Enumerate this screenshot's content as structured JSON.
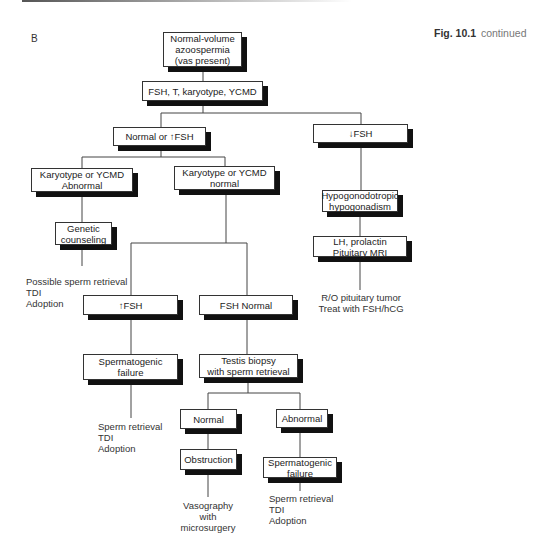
{
  "figure": {
    "panel_label": "B",
    "caption_bold": "Fig. 10.1",
    "caption_rest": "continued"
  },
  "nodes": {
    "root": "Normal-volume\nazoospermia\n(vas present)",
    "tests": "FSH, T, karyotype, YCMD",
    "normal_high_fsh": "Normal or ↑FSH",
    "low_fsh": "↓FSH",
    "karyotype_abnormal": "Karyotype or YCMD\nAbnormal",
    "karyotype_normal": "Karyotype or YCMD\nnormal",
    "genetic_counseling": "Genetic\ncounseling",
    "hypogonadotropic": "Hypogonodotropic\nhypogonadism",
    "lh_prolactin": "LH, prolactin\nPituitary MRI",
    "high_fsh": "↑FSH",
    "fsh_normal": "FSH Normal",
    "spermatogenic_failure_1": "Spermatogenic\nfailure",
    "testis_biopsy": "Testis biopsy\nwith sperm retrieval",
    "biopsy_normal": "Normal",
    "biopsy_abnormal": "Abnormal",
    "obstruction": "Obstruction",
    "spermatogenic_failure_2": "Spermatogenic\nfailure"
  },
  "outcomes": {
    "genetic": "Possible sperm retrieval\nTDI\nAdoption",
    "pituitary": "R/O pituitary tumor\nTreat with FSH/hCG",
    "spermatogenic_1": "Sperm retrieval\nTDI\nAdoption",
    "obstruction": "Vasography\nwith\nmicrosurgery",
    "spermatogenic_2": "Sperm retrieval\nTDI\nAdoption"
  }
}
